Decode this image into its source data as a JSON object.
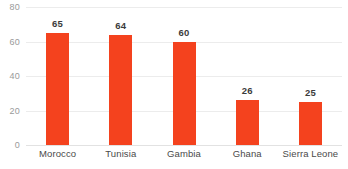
{
  "chart_data": {
    "type": "bar",
    "title": "",
    "subtitle": "",
    "xlabel": "",
    "ylabel": "",
    "categories": [
      "Morocco",
      "Tunisia",
      "Gambia",
      "Ghana",
      "Sierra Leone"
    ],
    "values": [
      65,
      64,
      60,
      26,
      25
    ],
    "value_labels": [
      "65",
      "64",
      "60",
      "26",
      "25"
    ],
    "ylim": [
      0,
      80
    ],
    "yticks": [
      0,
      20,
      40,
      60,
      80
    ],
    "ytick_labels": [
      "0",
      "20",
      "40",
      "60",
      "80"
    ],
    "grid": true,
    "grid_axis": "y",
    "legend": false,
    "legend_position": "none",
    "orientation": "vertical",
    "bar_color": "#F4421E",
    "background_color": "#FFFFFF",
    "gridline_color": "#ECECEC",
    "axis_label_color": "#9A9A9A",
    "value_label_color": "#3B3B3B",
    "category_label_color": "#4A4A4A"
  }
}
